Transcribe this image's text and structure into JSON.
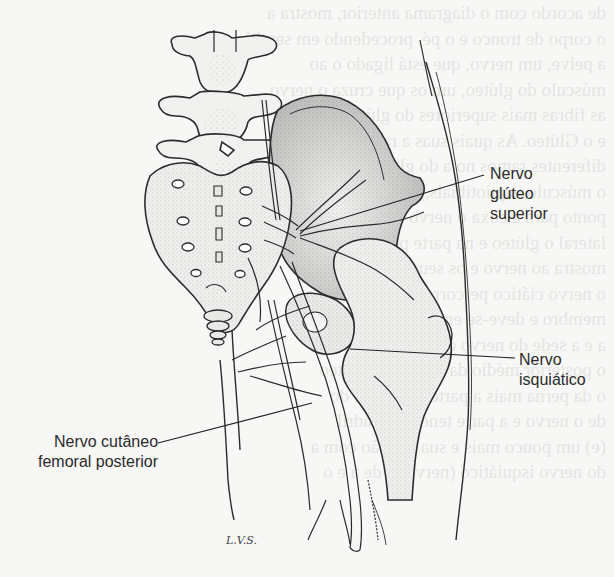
{
  "figure": {
    "labels": {
      "gluteo_superior": [
        "Nervo",
        "glúteo",
        "superior"
      ],
      "isquiatico": [
        "Nervo",
        "isquiático"
      ],
      "cutaneo_femoral_posterior": [
        "Nervo cutâneo",
        "femoral posterior"
      ]
    },
    "signature": "L.V.S."
  },
  "bleed_through_text": [
    "de acordo com o diagrama anterior, mostra a",
    "o corpo de tronco e o pé, procedendo em sentido",
    "a pelve, um nervo, que está ligado o ao",
    "músculo do glúteo, um os que cruza o nervo",
    "as fibras mais superiores do glúteo médio",
    "e o Glúteo. As quais suas a ramificação",
    "diferentes ramos no a do glúteo e a do",
    "o músculo isquiotibiais, que se prendem",
    "ponto para a coxa o nervo é a com ele",
    "lateral o glúteo e na parte posterior da coxa",
    "mostra ao nervo e os seus ramos de",
    "o nervo ciático percorre e ao seu trajeto",
    "membro e deve-se em ramo os da região",
    "a e a sede do nervo que em trajetos",
    "",
    "o posterior médio da coxa e do glúteo",
    "o da perna mais a parte da coxa e do",
    "de o nervo e a parte tendo o quadril",
    "(e) um pouco mais e sua relação com a",
    "do nervo isquiático (nervo) e de a e o"
  ],
  "colors": {
    "paper": "#f7f7f5",
    "ink": "#2b2b2b",
    "stipple": "#555555"
  }
}
